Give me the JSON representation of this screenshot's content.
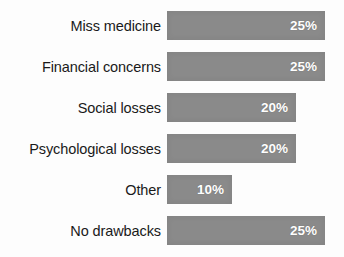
{
  "chart_data": {
    "type": "bar",
    "orientation": "horizontal",
    "title": "",
    "subtitle": "",
    "xlabel": "",
    "ylabel": "",
    "grid": false,
    "legend": false,
    "legend_position": "none",
    "axis_visible": false,
    "xlim": [
      0,
      25
    ],
    "value_suffix": "%",
    "bar_color": "#8a8a8a",
    "value_text_color": "#ffffff",
    "label_text_color": "#1a1a1a",
    "background_color": "#fdfdfd",
    "categories": [
      "Miss medicine",
      "Financial concerns",
      "Social losses",
      "Psychological losses",
      "Other",
      "No drawbacks"
    ],
    "values": [
      25,
      25,
      20,
      20,
      10,
      25
    ],
    "bars": [
      {
        "label": "Miss medicine",
        "value": 25,
        "value_label": "25%",
        "bar_width_px": 158
      },
      {
        "label": "Financial concerns",
        "value": 25,
        "value_label": "25%",
        "bar_width_px": 158
      },
      {
        "label": "Social losses",
        "value": 20,
        "value_label": "20%",
        "bar_width_px": 129
      },
      {
        "label": "Psychological losses",
        "value": 20,
        "value_label": "20%",
        "bar_width_px": 129
      },
      {
        "label": "Other",
        "value": 10,
        "value_label": "10%",
        "bar_width_px": 65
      },
      {
        "label": "No drawbacks",
        "value": 25,
        "value_label": "25%",
        "bar_width_px": 158
      }
    ]
  }
}
